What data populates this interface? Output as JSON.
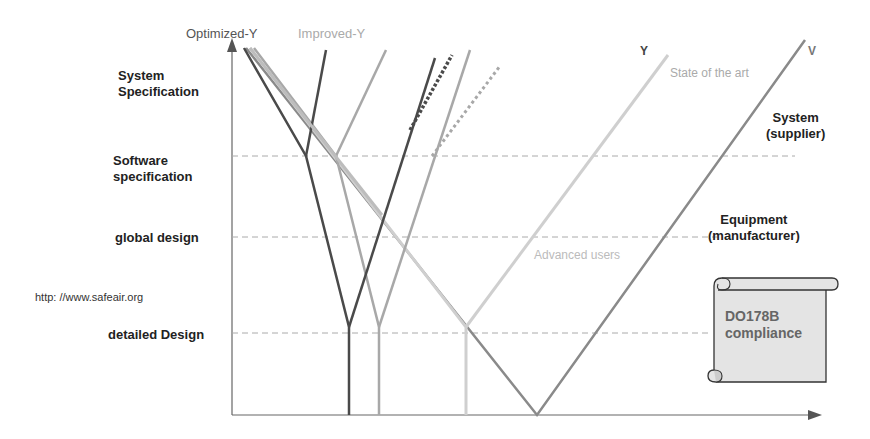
{
  "title_labels": {
    "optimized_y": "Optimized-Y",
    "improved_y": "Improved-Y",
    "y": "Y",
    "state_of_the_art": "State of the art",
    "v": "V",
    "advanced_users": "Advanced users"
  },
  "levels": [
    {
      "label_line1": "System",
      "label_line2": "Specification"
    },
    {
      "label_line1": "Software",
      "label_line2": "specification"
    },
    {
      "label_line1": "global design"
    },
    {
      "label_line1": "detailed Design"
    }
  ],
  "roles": {
    "system_line1": "System",
    "system_line2": "(supplier)",
    "equipment_line1": "Equipment",
    "equipment_line2": "(manufacturer)"
  },
  "url": "http: //www.safeair.org",
  "scroll": {
    "line1": "DO178B",
    "line2": "compliance"
  },
  "colors": {
    "optimized": "#4a4a4a",
    "improved": "#a8a8a8",
    "state_of_art": "#c8c8c8",
    "v": "#8a8a8a",
    "grid": "#aaaaaa"
  }
}
